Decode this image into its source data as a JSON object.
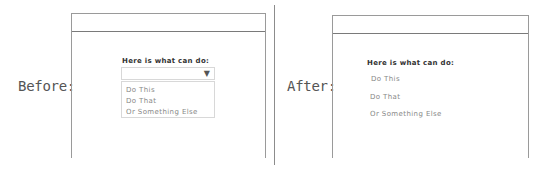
{
  "before": {
    "label": "Before:",
    "heading": "Here is what can do:",
    "dropdown": {
      "caret_icon": "▼",
      "options": [
        "Do This",
        "Do That",
        "Or Something Else"
      ]
    }
  },
  "after": {
    "label": "After:",
    "heading": "Here is what can do:",
    "options": [
      "Do This",
      "Do That",
      "Or Something Else"
    ]
  },
  "colors": {
    "frame_border": "#9a9a9a",
    "heading_text": "#333333",
    "option_text": "#888888",
    "label_text": "#555555"
  }
}
